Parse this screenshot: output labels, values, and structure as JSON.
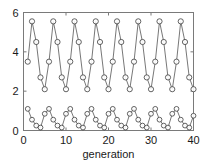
{
  "chart_data": {
    "type": "line",
    "title": "",
    "xlabel": "generation",
    "ylabel": "",
    "xlim": [
      0,
      40
    ],
    "ylim": [
      0,
      6
    ],
    "xticks": [
      0,
      10,
      20,
      30,
      40
    ],
    "xtick_labels": [
      "0",
      "10",
      "20",
      "30",
      "40"
    ],
    "yticks": [
      0,
      2,
      4,
      6
    ],
    "ytick_labels": [
      "0",
      "2",
      "4",
      "6"
    ],
    "grid": false,
    "legend": null,
    "marker": "circle-open",
    "line_color": "#3c3c3c",
    "marker_edge_color": "#3c3c3c",
    "marker_face_color": "none",
    "axes_color": "#7a7a7a",
    "background_color": "#ffffff",
    "x": [
      1,
      2,
      3,
      4,
      5,
      6,
      7,
      8,
      9,
      10,
      11,
      12,
      13,
      14,
      15,
      16,
      17,
      18,
      19,
      20,
      21,
      22,
      23,
      24,
      25,
      26,
      27,
      28,
      29,
      30,
      31,
      32,
      33,
      34,
      35,
      36,
      37,
      38,
      39,
      40
    ],
    "series": [
      {
        "name": "upper",
        "values": [
          3.5,
          5.55,
          4.5,
          2.7,
          2.1,
          3.5,
          5.55,
          4.5,
          2.7,
          2.1,
          3.5,
          5.55,
          4.5,
          2.7,
          2.1,
          3.5,
          5.55,
          4.5,
          2.7,
          2.1,
          3.5,
          5.55,
          4.5,
          2.7,
          2.1,
          3.5,
          5.55,
          4.5,
          2.7,
          2.1,
          3.5,
          5.55,
          4.5,
          2.7,
          2.1,
          3.5,
          5.55,
          4.5,
          2.7,
          2.1
        ]
      },
      {
        "name": "lower",
        "values": [
          1.1,
          0.55,
          0.25,
          0.15,
          0.85,
          1.1,
          0.55,
          0.25,
          0.15,
          0.85,
          1.1,
          0.55,
          0.25,
          0.15,
          0.85,
          1.1,
          0.55,
          0.25,
          0.15,
          0.85,
          1.1,
          0.55,
          0.25,
          0.15,
          0.85,
          1.1,
          0.55,
          0.25,
          0.15,
          0.85,
          1.1,
          0.55,
          0.25,
          0.15,
          0.85,
          1.1,
          0.55,
          0.25,
          0.15,
          0.75
        ]
      }
    ]
  }
}
